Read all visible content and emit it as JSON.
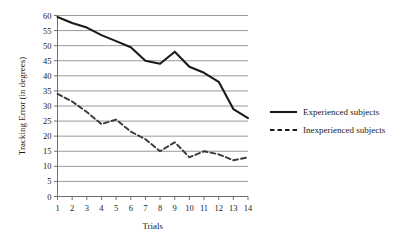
{
  "chart_data": {
    "type": "line",
    "title": "",
    "xlabel": "Trials",
    "ylabel": "Tracking Error (in degrees)",
    "x": [
      1,
      2,
      3,
      4,
      5,
      6,
      7,
      8,
      9,
      10,
      11,
      12,
      13,
      14
    ],
    "xticklabels": [
      "1",
      "2",
      "3",
      "4",
      "5",
      "6",
      "7",
      "8",
      "9",
      "10",
      "11",
      "12",
      "13",
      "14"
    ],
    "yticklabels": [
      "0",
      "5",
      "10",
      "15",
      "20",
      "25",
      "30",
      "35",
      "40",
      "45",
      "50",
      "55",
      "60"
    ],
    "yticks": [
      0,
      5,
      10,
      15,
      20,
      25,
      30,
      35,
      40,
      45,
      50,
      55,
      60
    ],
    "xlim": [
      1,
      14
    ],
    "ylim": [
      0,
      60
    ],
    "grid": "horizontal",
    "legend_position": "right",
    "series": [
      {
        "name": "Experienced subjects",
        "style": "solid",
        "color": "#1a1a1a",
        "values": [
          59.5,
          57.5,
          56,
          53.5,
          51.5,
          49.5,
          45,
          44,
          48,
          43,
          41,
          38,
          29,
          26
        ]
      },
      {
        "name": "Inexperienced subjects",
        "style": "dashed",
        "color": "#3a3a3a",
        "values": [
          34,
          31.5,
          28,
          24,
          25.5,
          21.5,
          19,
          15,
          18,
          13,
          15,
          14,
          12,
          13
        ]
      }
    ]
  },
  "axes": {
    "ylabel": "Tracking Error (in degrees)",
    "xlabel": "Trials"
  },
  "legend": {
    "items": [
      {
        "label": "Experienced subjects",
        "style": "solid"
      },
      {
        "label": "Inexperienced subjects",
        "style": "dashed"
      }
    ]
  },
  "colors": {
    "line": "#1a1a1a",
    "grid": "#9a9a9a",
    "axis": "#6e6e6e",
    "background": "#ffffff"
  }
}
